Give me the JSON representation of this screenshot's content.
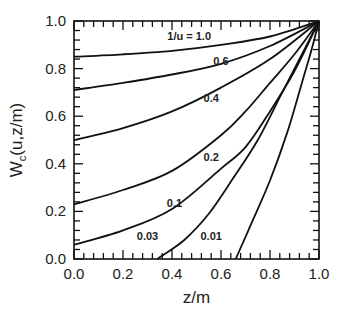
{
  "chart_data": {
    "type": "line",
    "title": "",
    "xlabel": "z/m",
    "ylabel": "W_c(u,z/m)",
    "xlim": [
      0.0,
      1.0
    ],
    "ylim": [
      0.0,
      1.0
    ],
    "grid": false,
    "legend_position": "inline labels",
    "x_ticks": [
      "0.0",
      "0.2",
      "0.4",
      "0.6",
      "0.8",
      "1.0"
    ],
    "y_ticks": [
      "0.0",
      "0.2",
      "0.4",
      "0.6",
      "0.8",
      "1.0"
    ],
    "series": [
      {
        "name": "1/u = 1.0",
        "label": "1/u = 1.0",
        "label_pos": [
          0.47,
          0.92
        ],
        "points": [
          [
            0.0,
            0.85
          ],
          [
            0.2,
            0.86
          ],
          [
            0.4,
            0.875
          ],
          [
            0.6,
            0.9
          ],
          [
            0.8,
            0.935
          ],
          [
            1.0,
            1.0
          ]
        ]
      },
      {
        "name": "0.6",
        "label": "0.6",
        "label_pos": [
          0.6,
          0.815
        ],
        "points": [
          [
            0.0,
            0.71
          ],
          [
            0.2,
            0.74
          ],
          [
            0.4,
            0.775
          ],
          [
            0.6,
            0.82
          ],
          [
            0.8,
            0.895
          ],
          [
            1.0,
            1.0
          ]
        ]
      },
      {
        "name": "0.4",
        "label": "0.4",
        "label_pos": [
          0.56,
          0.66
        ],
        "points": [
          [
            0.0,
            0.5
          ],
          [
            0.2,
            0.55
          ],
          [
            0.4,
            0.62
          ],
          [
            0.6,
            0.72
          ],
          [
            0.8,
            0.84
          ],
          [
            1.0,
            1.0
          ]
        ]
      },
      {
        "name": "0.2",
        "label": "0.2",
        "label_pos": [
          0.56,
          0.41
        ],
        "points": [
          [
            0.0,
            0.23
          ],
          [
            0.2,
            0.29
          ],
          [
            0.4,
            0.37
          ],
          [
            0.6,
            0.52
          ],
          [
            0.7,
            0.62
          ],
          [
            0.8,
            0.74
          ],
          [
            0.9,
            0.86
          ],
          [
            1.0,
            1.0
          ]
        ]
      },
      {
        "name": "0.1",
        "label": "0.1",
        "label_pos": [
          0.41,
          0.22
        ],
        "points": [
          [
            0.0,
            0.06
          ],
          [
            0.2,
            0.12
          ],
          [
            0.4,
            0.21
          ],
          [
            0.6,
            0.38
          ],
          [
            0.7,
            0.47
          ],
          [
            0.8,
            0.62
          ],
          [
            0.9,
            0.79
          ],
          [
            1.0,
            1.0
          ]
        ]
      },
      {
        "name": "0.03",
        "label": "0.03",
        "label_pos": [
          0.3,
          0.08
        ],
        "points": [
          [
            0.34,
            0.0
          ],
          [
            0.45,
            0.08
          ],
          [
            0.55,
            0.19
          ],
          [
            0.65,
            0.34
          ],
          [
            0.75,
            0.5
          ],
          [
            0.85,
            0.7
          ],
          [
            0.93,
            0.86
          ],
          [
            1.0,
            1.0
          ]
        ]
      },
      {
        "name": "0.01",
        "label": "0.01",
        "label_pos": [
          0.56,
          0.08
        ],
        "points": [
          [
            0.66,
            0.0
          ],
          [
            0.72,
            0.14
          ],
          [
            0.8,
            0.33
          ],
          [
            0.87,
            0.53
          ],
          [
            0.93,
            0.74
          ],
          [
            0.97,
            0.88
          ],
          [
            1.0,
            1.0
          ]
        ]
      }
    ]
  },
  "layout": {
    "plot_left": 74,
    "plot_right": 319,
    "plot_top": 21,
    "plot_bottom": 259,
    "minor_x_per_major": 4,
    "minor_y_per_major": 4
  }
}
